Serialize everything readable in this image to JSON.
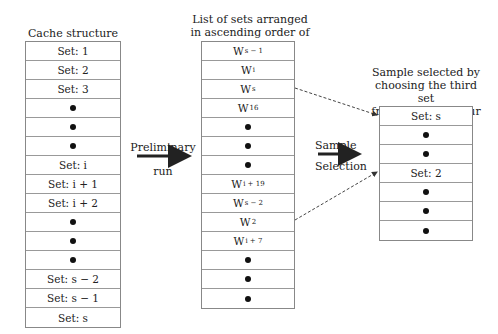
{
  "cache_structure": {
    "title": "Cache structure",
    "rows": [
      {
        "type": "text",
        "label": "Set: 1"
      },
      {
        "type": "text",
        "label": "Set: 2"
      },
      {
        "type": "text",
        "label": "Set: 3"
      },
      {
        "type": "dot"
      },
      {
        "type": "dot"
      },
      {
        "type": "dot"
      },
      {
        "type": "text",
        "label": "Set: i"
      },
      {
        "type": "text",
        "label": "Set: i + 1"
      },
      {
        "type": "text",
        "label": "Set: i + 2"
      },
      {
        "type": "dot"
      },
      {
        "type": "dot"
      },
      {
        "type": "dot"
      },
      {
        "type": "text",
        "label": "Set: s − 2"
      },
      {
        "type": "text",
        "label": "Set: s − 1"
      },
      {
        "type": "text",
        "label": "Set: s"
      }
    ]
  },
  "preliminary_arrow": {
    "label_top": "Preliminary",
    "label_bottom": "run"
  },
  "sorted_list": {
    "title_line1": "List of sets arranged",
    "title_line2": "in ascending order of weighted miss",
    "rows": [
      {
        "type": "w",
        "base": "W",
        "sub": "s − 1"
      },
      {
        "type": "w",
        "base": "W",
        "sub": "i"
      },
      {
        "type": "w",
        "base": "W",
        "sub": "s"
      },
      {
        "type": "w",
        "base": "W",
        "sub": "16"
      },
      {
        "type": "dot"
      },
      {
        "type": "dot"
      },
      {
        "type": "dot"
      },
      {
        "type": "w",
        "base": "W",
        "sub": "i + 19"
      },
      {
        "type": "w",
        "base": "W",
        "sub": "s − 2"
      },
      {
        "type": "w",
        "base": "W",
        "sub": "2"
      },
      {
        "type": "w",
        "base": "W",
        "sub": "i + 7"
      },
      {
        "type": "dot"
      },
      {
        "type": "dot"
      },
      {
        "type": "dot"
      }
    ]
  },
  "sample_arrow": {
    "label_top": "Sample",
    "label_bottom": "Selection"
  },
  "sample": {
    "title_line1": "Sample selected by",
    "title_line2": "choosing the third set",
    "title_line3": "from groups of four",
    "rows": [
      {
        "type": "text",
        "label": "Set: s"
      },
      {
        "type": "dot"
      },
      {
        "type": "dot"
      },
      {
        "type": "text",
        "label": "Set: 2"
      },
      {
        "type": "dot"
      },
      {
        "type": "dot"
      },
      {
        "type": "dot"
      }
    ]
  }
}
